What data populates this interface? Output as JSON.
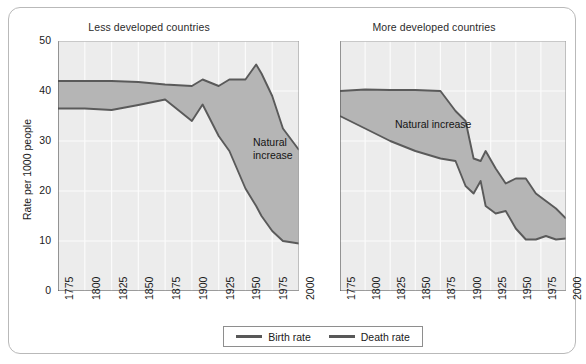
{
  "figure": {
    "ylabel": "Rate per 1000 people",
    "annotation_label": "Natural increase",
    "legend": {
      "birth_label": "Birth rate",
      "death_label": "Death rate",
      "line_color": "#585858"
    },
    "colors": {
      "plot_background": "#ececec",
      "grid": "#fbfbfb",
      "fill": "#b5b5b5",
      "line": "#5a5a5a",
      "axis": "#4a4a4a",
      "frame": "#b9b9b9"
    }
  },
  "chart_data": [
    {
      "type": "area",
      "title": "Less developed countries",
      "xlabel": "",
      "ylabel": "Rate per 1000 people",
      "xlim": [
        1775,
        2000
      ],
      "ylim": [
        0,
        50
      ],
      "yticks": [
        0,
        10,
        20,
        30,
        40,
        50
      ],
      "xticks": [
        1775,
        1800,
        1825,
        1850,
        1875,
        1900,
        1925,
        1950,
        1975,
        2000
      ],
      "grid": true,
      "annotation": "Natural increase",
      "x": [
        1775,
        1800,
        1825,
        1850,
        1875,
        1900,
        1910,
        1925,
        1935,
        1950,
        1960,
        1965,
        1975,
        1985,
        2000
      ],
      "series": [
        {
          "name": "Birth rate",
          "values": [
            42.0,
            42.0,
            42.0,
            41.8,
            41.3,
            41.0,
            42.3,
            41.0,
            42.3,
            42.3,
            45.3,
            43.5,
            39.0,
            32.5,
            28.2
          ]
        },
        {
          "name": "Death rate",
          "values": [
            36.5,
            36.5,
            36.2,
            37.2,
            38.3,
            34.0,
            37.3,
            31.0,
            28.0,
            20.5,
            17.0,
            15.0,
            12.0,
            10.0,
            9.5
          ]
        }
      ]
    },
    {
      "type": "area",
      "title": "More developed countries",
      "xlabel": "",
      "ylabel": "",
      "xlim": [
        1775,
        2000
      ],
      "ylim": [
        0,
        50
      ],
      "yticks": [
        0,
        10,
        20,
        30,
        40,
        50
      ],
      "xticks": [
        1775,
        1800,
        1825,
        1850,
        1875,
        1900,
        1925,
        1950,
        1975,
        2000
      ],
      "grid": true,
      "annotation": "Natural increase",
      "x": [
        1775,
        1800,
        1825,
        1850,
        1875,
        1890,
        1900,
        1908,
        1915,
        1920,
        1930,
        1940,
        1950,
        1960,
        1970,
        1980,
        1990,
        2000
      ],
      "series": [
        {
          "name": "Birth rate",
          "values": [
            40.0,
            40.3,
            40.2,
            40.2,
            40.0,
            36.0,
            34.0,
            26.5,
            26.0,
            28.0,
            24.5,
            21.5,
            22.5,
            22.5,
            19.5,
            18.0,
            16.5,
            14.5
          ]
        },
        {
          "name": "Death rate",
          "values": [
            35.0,
            32.5,
            30.0,
            28.0,
            26.5,
            26.0,
            21.0,
            19.5,
            22.0,
            17.0,
            15.5,
            16.0,
            12.5,
            10.3,
            10.3,
            11.0,
            10.3,
            10.5
          ]
        }
      ]
    }
  ]
}
